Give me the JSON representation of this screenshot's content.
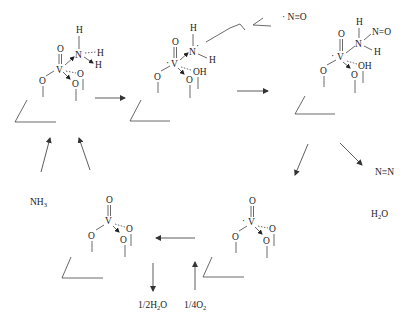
{
  "diagram": {
    "type": "catalytic-cycle",
    "title": "",
    "species": {
      "s1": {
        "V": "V",
        "O_top": "O",
        "N": "N",
        "H1": "H",
        "H2": "H",
        "H3": "H",
        "O_left": "O",
        "O_right": "O",
        "O_low": "O"
      },
      "s2": {
        "V": "V",
        "O_top": "O",
        "N": "N",
        "H1": "H",
        "H2": "H",
        "OH": "OH",
        "O_left": "O",
        "O_low": "O"
      },
      "s3": {
        "V": "V",
        "O_top": "O",
        "N": "N",
        "NO_group": "N=O",
        "H1": "H",
        "H2": "H",
        "OH": "OH",
        "O_left": "O",
        "O_low": "O"
      },
      "s4": {
        "V": "V",
        "O_top": "O",
        "O_right": "O",
        "O_left": "O",
        "O_low": "O"
      },
      "s5": {
        "V": "V",
        "O_top": "O",
        "O_right": "O",
        "O_left": "O",
        "O_low": "O"
      }
    },
    "labels": {
      "nitric_oxide": "· N≡O",
      "nitrogen": "N≡N",
      "water": "H",
      "water_sub": "2",
      "water_tail": "O",
      "ammonia": "NH",
      "ammonia_sub": "3",
      "half_water": "1/2H",
      "half_water_sub": "2",
      "half_water_tail": "O",
      "quarter_oxygen": "1/4O",
      "quarter_oxygen_sub": "2"
    },
    "colors": {
      "ink": "#222222",
      "background": "#ffffff"
    }
  }
}
